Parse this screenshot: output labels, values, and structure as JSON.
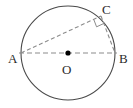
{
  "figure": {
    "background_color": "#ffffff",
    "labels": {
      "a": "A",
      "b": "B",
      "c": "C",
      "o": "O"
    },
    "colors": {
      "circle_stroke": "#4a4a4a",
      "chord_stroke": "#8c8c8c",
      "diameter_stroke": "#8c8c8c",
      "center_dot": "#000000",
      "right_angle_stroke": "#8c8c8c",
      "label_text": "#2b2b2b"
    },
    "geometry": {
      "circle": {
        "cx": 68,
        "cy": 53,
        "r": 47
      },
      "points": {
        "A": {
          "x": 21,
          "y": 53
        },
        "B": {
          "x": 115,
          "y": 53
        },
        "C": {
          "x": 101,
          "y": 16
        },
        "O": {
          "x": 68,
          "y": 53
        }
      },
      "segments": [
        {
          "name": "diameter-AB",
          "from": "A",
          "to": "B",
          "style": "dashed"
        },
        {
          "name": "chord-AC",
          "from": "A",
          "to": "C",
          "style": "dashed"
        },
        {
          "name": "chord-CB",
          "from": "C",
          "to": "B",
          "style": "dashed"
        }
      ],
      "right_angle_marker": {
        "at": "C",
        "size": 8
      },
      "center_dot_radius": 2.6
    }
  }
}
